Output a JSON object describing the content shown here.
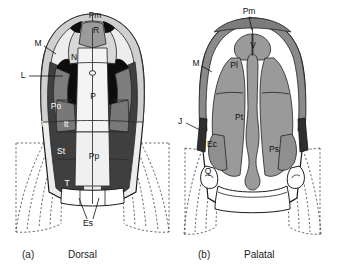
{
  "figure": {
    "panels": [
      {
        "id": "a",
        "letter": "(a)",
        "caption": "Dorsal",
        "labels": [
          {
            "key": "Pm",
            "text": "Pm",
            "name": "premaxilla",
            "style": "dark",
            "x": 95,
            "y": 16
          },
          {
            "key": "R",
            "text": "R",
            "name": "rostral",
            "style": "dark",
            "x": 96,
            "y": 31
          },
          {
            "key": "M",
            "text": "M",
            "name": "maxilla",
            "style": "dark",
            "x": 38,
            "y": 44
          },
          {
            "key": "N",
            "text": "N",
            "name": "nasal",
            "style": "dark",
            "x": 74,
            "y": 58
          },
          {
            "key": "L",
            "text": "L",
            "name": "lacrimal",
            "style": "dark",
            "x": 23,
            "y": 76
          },
          {
            "key": "P",
            "text": "P",
            "name": "parietal",
            "style": "dark",
            "x": 93,
            "y": 97
          },
          {
            "key": "Po",
            "text": "Po",
            "name": "postorbital",
            "style": "light",
            "x": 56,
            "y": 107
          },
          {
            "key": "J",
            "text": "J",
            "name": "jugal",
            "style": "light",
            "x": 41,
            "y": 125
          },
          {
            "key": "It",
            "text": "It",
            "name": "intertemporal",
            "style": "light",
            "x": 66,
            "y": 125
          },
          {
            "key": "St",
            "text": "St",
            "name": "supratemporal",
            "style": "light",
            "x": 61,
            "y": 152
          },
          {
            "key": "Pp",
            "text": "Pp",
            "name": "postparietal",
            "style": "dark",
            "x": 94,
            "y": 157
          },
          {
            "key": "T",
            "text": "T",
            "name": "tabular",
            "style": "light",
            "x": 67,
            "y": 184
          },
          {
            "key": "Es",
            "text": "Es",
            "name": "extrascapular",
            "style": "dark",
            "x": 88,
            "y": 224
          }
        ]
      },
      {
        "id": "b",
        "letter": "(b)",
        "caption": "Palatal",
        "labels": [
          {
            "key": "Pm",
            "text": "Pm",
            "name": "premaxilla",
            "style": "dark",
            "x": 249,
            "y": 12
          },
          {
            "key": "V",
            "text": "V",
            "name": "vomer",
            "style": "dark",
            "x": 253,
            "y": 46
          },
          {
            "key": "M",
            "text": "M",
            "name": "maxilla",
            "style": "dark",
            "x": 196,
            "y": 64
          },
          {
            "key": "Pl",
            "text": "Pl",
            "name": "palatine",
            "style": "dark",
            "x": 234,
            "y": 66
          },
          {
            "key": "Pt",
            "text": "Pt",
            "name": "pterygoid",
            "style": "dark",
            "x": 239,
            "y": 118
          },
          {
            "key": "J",
            "text": "J",
            "name": "jugal",
            "style": "dark",
            "x": 180,
            "y": 122
          },
          {
            "key": "Ec",
            "text": "Ec",
            "name": "ectopterygoid",
            "style": "dark",
            "x": 212,
            "y": 145
          },
          {
            "key": "Ps",
            "text": "Ps",
            "name": "parasphenoid",
            "style": "dark",
            "x": 274,
            "y": 150
          },
          {
            "key": "Q",
            "text": "Q",
            "name": "quadrate",
            "style": "dark",
            "x": 208,
            "y": 172
          }
        ]
      }
    ],
    "captions": [
      {
        "letter": "(a)",
        "text": "Dorsal",
        "lx": 22,
        "ly": 255,
        "tx": 68,
        "ty": 255
      },
      {
        "letter": "(b)",
        "text": "Palatal",
        "lx": 198,
        "ly": 255,
        "tx": 244,
        "ty": 255
      }
    ],
    "colors": {
      "black": "#111111",
      "dark_gray": "#4a4a4a",
      "mid_gray": "#8e8e8e",
      "light_gray": "#c9c9c9",
      "pale_gray": "#e4e4e4",
      "near_white": "#f2f2f2",
      "white": "#ffffff",
      "palate_gray": "#9a9a9a",
      "outline": "#1a1a1a"
    }
  }
}
